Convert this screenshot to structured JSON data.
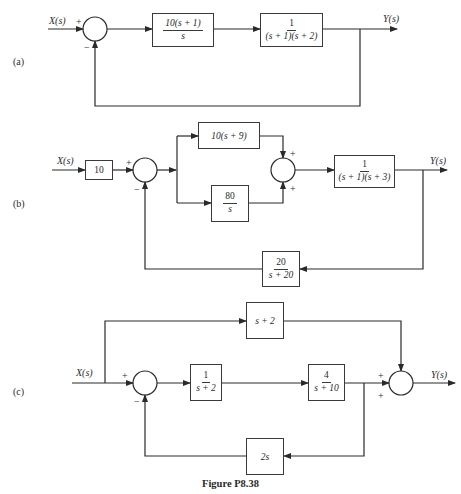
{
  "figure": {
    "caption": "Figure P8.38"
  },
  "diagrams": [
    {
      "panel_label": "(a)",
      "input_label": "X(s)",
      "output_label": "Y(s)",
      "summing_junctions": [
        {
          "signs": {
            "left": "+",
            "bottom": "−"
          }
        }
      ],
      "blocks": [
        {
          "id": "G1",
          "numerator": "10(s + 1)",
          "denominator": "s"
        },
        {
          "id": "G2",
          "numerator": "1",
          "denominator": "(s + 1)(s + 2)"
        }
      ],
      "feedback": "unity negative"
    },
    {
      "panel_label": "(b)",
      "input_label": "X(s)",
      "output_label": "Y(s)",
      "summing_junctions": [
        {
          "signs": {
            "left": "+",
            "bottom": "−"
          }
        },
        {
          "signs": {
            "top": "+",
            "bottom": "+"
          }
        }
      ],
      "blocks": [
        {
          "id": "K",
          "text": "10"
        },
        {
          "id": "P",
          "text": "10(s + 9)"
        },
        {
          "id": "I",
          "numerator": "80",
          "denominator": "s"
        },
        {
          "id": "G",
          "numerator": "1",
          "denominator": "(s + 1)(s + 3)"
        },
        {
          "id": "H",
          "numerator": "20",
          "denominator": "s + 20"
        }
      ]
    },
    {
      "panel_label": "(c)",
      "input_label": "X(s)",
      "output_label": "Y(s)",
      "summing_junctions": [
        {
          "signs": {
            "left": "+",
            "bottom": "−"
          }
        },
        {
          "signs": {
            "left": "+",
            "bottom": "+"
          }
        }
      ],
      "blocks": [
        {
          "id": "FF",
          "text": "s + 2"
        },
        {
          "id": "G1",
          "numerator": "1",
          "denominator": "s + 2"
        },
        {
          "id": "G2",
          "numerator": "4",
          "denominator": "s + 10"
        },
        {
          "id": "H",
          "text": "2s"
        }
      ]
    }
  ]
}
